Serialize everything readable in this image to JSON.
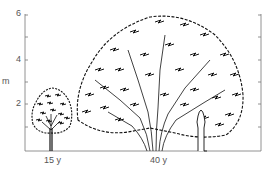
{
  "diagram": {
    "y_axis": {
      "unit_label": "m",
      "tick_labels": [
        "6",
        "4",
        "2"
      ],
      "range": [
        0,
        6
      ]
    },
    "trees": [
      {
        "age_label": "15 y",
        "height_m": 2.9
      },
      {
        "age_label": "40 y",
        "height_m": 6.2
      }
    ],
    "scale_figure": "human-silhouette"
  }
}
